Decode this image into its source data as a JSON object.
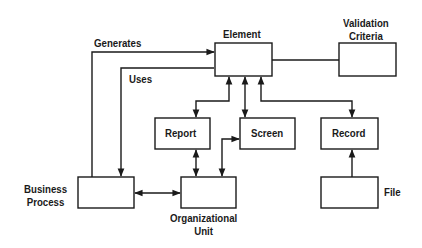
{
  "diagram": {
    "nodes": [
      {
        "id": "element",
        "label": "Element"
      },
      {
        "id": "validation_criteria",
        "label": "Validation\nCriteria"
      },
      {
        "id": "report",
        "label": "Report"
      },
      {
        "id": "screen",
        "label": "Screen"
      },
      {
        "id": "record",
        "label": "Record"
      },
      {
        "id": "business_process",
        "label": "Business\nProcess"
      },
      {
        "id": "organizational_unit",
        "label": "Organizational\nUnit"
      },
      {
        "id": "file",
        "label": "File"
      }
    ],
    "edges": [
      {
        "from": "business_process",
        "to": "element",
        "label": "Generates",
        "direction": "forward"
      },
      {
        "from": "business_process",
        "to": "element",
        "label": "Uses",
        "direction": "backward"
      },
      {
        "from": "element",
        "to": "validation_criteria",
        "label": "",
        "direction": "none"
      },
      {
        "from": "element",
        "to": "report",
        "label": "",
        "direction": "both"
      },
      {
        "from": "element",
        "to": "screen",
        "label": "",
        "direction": "both"
      },
      {
        "from": "element",
        "to": "record",
        "label": "",
        "direction": "both"
      },
      {
        "from": "report",
        "to": "organizational_unit",
        "label": "",
        "direction": "both"
      },
      {
        "from": "screen",
        "to": "organizational_unit",
        "label": "",
        "direction": "both"
      },
      {
        "from": "business_process",
        "to": "organizational_unit",
        "label": "",
        "direction": "both"
      },
      {
        "from": "file",
        "to": "record",
        "label": "",
        "direction": "forward"
      }
    ],
    "labels": {
      "element": "Element",
      "validation_criteria": "Validation\nCriteria",
      "report": "Report",
      "screen": "Screen",
      "record": "Record",
      "business_process": "Business\nProcess",
      "organizational_unit": "Organizational\nUnit",
      "file": "File",
      "generates": "Generates",
      "uses": "Uses"
    }
  }
}
